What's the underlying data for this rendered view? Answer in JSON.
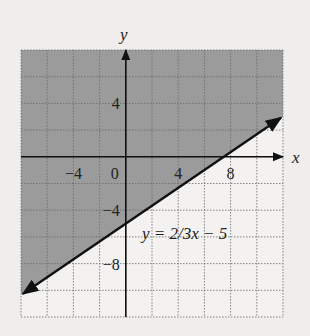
{
  "chart_data": {
    "type": "line",
    "title": "",
    "xlabel": "x",
    "ylabel": "y",
    "xlim": [
      -8,
      12
    ],
    "ylim": [
      -12,
      8
    ],
    "grid": true,
    "grid_step": 2,
    "x_ticks": [
      {
        "value": -4,
        "label": "−4"
      },
      {
        "value": 0,
        "label": "0"
      },
      {
        "value": 4,
        "label": "4"
      },
      {
        "value": 8,
        "label": "8"
      }
    ],
    "y_ticks": [
      {
        "value": 4,
        "label": "4"
      },
      {
        "value": -4,
        "label": "−4"
      },
      {
        "value": -8,
        "label": "−8"
      }
    ],
    "series": [
      {
        "name": "y = 2/3x − 5",
        "slope": 0.6667,
        "intercept": -5,
        "x": [
          -8,
          12
        ],
        "y": [
          -10.33,
          3
        ]
      }
    ],
    "shaded_region": "above line (y ≥ 2/3x − 5)",
    "annotations": [
      {
        "text": "y = 2/3x − 5",
        "x": 3.5,
        "y": -6
      }
    ],
    "colors": {
      "shade": "#9b9b9b",
      "background": "#efeeec",
      "line": "#111111",
      "grid": "#6a6a6a"
    }
  },
  "labels": {
    "x_axis": "x",
    "y_axis": "y",
    "equation": "y = 2/3x − 5"
  }
}
